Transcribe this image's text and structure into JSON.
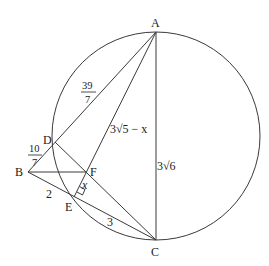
{
  "diagram": {
    "type": "geometry",
    "circle": {
      "cx": 156,
      "cy": 136,
      "r": 104
    },
    "points": {
      "A": {
        "label": "A",
        "x": 156,
        "y": 32
      },
      "B": {
        "label": "B",
        "x": 28,
        "y": 172
      },
      "C": {
        "label": "C",
        "x": 156,
        "y": 240
      },
      "D": {
        "label": "D",
        "x": 55,
        "y": 142
      },
      "E": {
        "label": "E",
        "x": 74,
        "y": 197
      },
      "F": {
        "label": "F",
        "x": 86,
        "y": 172
      }
    },
    "segments": [
      "AC",
      "AB",
      "AE",
      "BC",
      "BF",
      "DC"
    ],
    "measures": {
      "AD": {
        "num": "39",
        "den": "7"
      },
      "BD": {
        "num": "10",
        "den": "7"
      },
      "AF": "3√5 − x",
      "AC": "3√6",
      "BE": "2",
      "EC": "3",
      "EF": "x"
    },
    "right_angle_at": "E"
  }
}
